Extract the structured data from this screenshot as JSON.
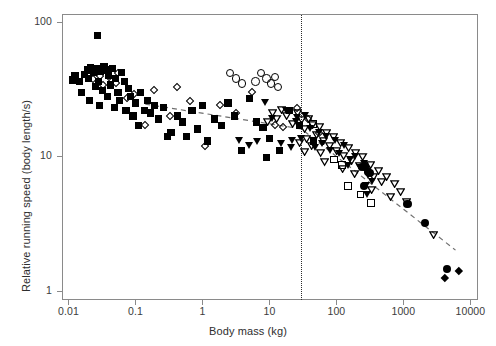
{
  "chart_data": {
    "type": "scatter",
    "title": "",
    "xlabel": "Body mass (kg)",
    "ylabel": "Relative running speed (body length/s)",
    "xscale": "log",
    "yscale": "log",
    "xlim": [
      0.008,
      13000
    ],
    "ylim": [
      0.85,
      115
    ],
    "xticks": [
      "0.01",
      "0.1",
      "1",
      "10",
      "100",
      "1000",
      "10000"
    ],
    "xtick_values": [
      0.01,
      0.1,
      1,
      10,
      100,
      1000,
      10000
    ],
    "yticks": [
      "100",
      "10",
      "1"
    ],
    "ytick_values": [
      100,
      10,
      1
    ],
    "grid": false,
    "legend": "none",
    "annotations": [
      {
        "name": "critical-mass-line",
        "type": "vertical-dotted-line",
        "x": 30,
        "label": ""
      },
      {
        "name": "trend-line",
        "type": "dashed-broken-line",
        "points": [
          [
            0.14,
            24.5
          ],
          [
            30,
            16.0
          ],
          [
            6000,
            2.0
          ]
        ]
      }
    ],
    "series": [
      {
        "name": "filled-square",
        "marker": "filled-square",
        "color": "#000000",
        "points": [
          [
            0.0115,
            37.0
          ],
          [
            0.0125,
            40.0
          ],
          [
            0.0145,
            36.0
          ],
          [
            0.0155,
            30.0
          ],
          [
            0.0175,
            41.0
          ],
          [
            0.019,
            44.0
          ],
          [
            0.02,
            38.0
          ],
          [
            0.0205,
            26.0
          ],
          [
            0.0215,
            46.0
          ],
          [
            0.0235,
            42.0
          ],
          [
            0.025,
            33.0
          ],
          [
            0.026,
            45.0
          ],
          [
            0.027,
            80.0
          ],
          [
            0.028,
            36.0
          ],
          [
            0.029,
            24.0
          ],
          [
            0.03,
            43.0
          ],
          [
            0.032,
            31.0
          ],
          [
            0.034,
            47.0
          ],
          [
            0.036,
            44.0
          ],
          [
            0.038,
            28.0
          ],
          [
            0.04,
            40.0
          ],
          [
            0.042,
            34.0
          ],
          [
            0.045,
            45.0
          ],
          [
            0.048,
            23.0
          ],
          [
            0.05,
            38.0
          ],
          [
            0.055,
            30.0
          ],
          [
            0.058,
            26.0
          ],
          [
            0.062,
            42.0
          ],
          [
            0.068,
            36.0
          ],
          [
            0.072,
            22.0
          ],
          [
            0.078,
            32.0
          ],
          [
            0.085,
            28.0
          ],
          [
            0.092,
            20.0
          ],
          [
            0.1,
            25.0
          ],
          [
            0.11,
            17.0
          ],
          [
            0.12,
            30.0
          ],
          [
            0.135,
            22.0
          ],
          [
            0.15,
            26.0
          ],
          [
            0.17,
            21.0
          ],
          [
            0.19,
            24.0
          ],
          [
            0.22,
            19.0
          ],
          [
            0.26,
            23.0
          ],
          [
            0.3,
            14.0
          ],
          [
            0.34,
            15.0
          ],
          [
            0.42,
            20.0
          ],
          [
            0.5,
            18.0
          ],
          [
            0.58,
            14.0
          ],
          [
            0.7,
            22.0
          ],
          [
            0.85,
            16.0
          ],
          [
            1.0,
            24.0
          ],
          [
            1.2,
            13.0
          ],
          [
            1.5,
            19.0
          ],
          [
            1.9,
            17.0
          ],
          [
            2.4,
            25.0
          ],
          [
            3.0,
            20.0
          ],
          [
            3.8,
            11.0
          ],
          [
            5.0,
            27.0
          ],
          [
            6.5,
            18.0
          ],
          [
            8.0,
            16.5
          ],
          [
            10.0,
            13.5
          ],
          [
            14.0,
            11.0
          ],
          [
            20.0,
            22.0
          ],
          [
            28.0,
            17.0
          ],
          [
            45.0,
            13.0
          ],
          [
            9.0,
            9.8
          ]
        ]
      },
      {
        "name": "open-diamond",
        "marker": "open-diamond",
        "color": "#000000",
        "points": [
          [
            0.023,
            38.0
          ],
          [
            0.03,
            40.0
          ],
          [
            0.033,
            34.0
          ],
          [
            0.04,
            39.0
          ],
          [
            0.052,
            35.0
          ],
          [
            0.075,
            27.0
          ],
          [
            0.095,
            29.0
          ],
          [
            0.14,
            17.0
          ],
          [
            0.19,
            31.0
          ],
          [
            0.33,
            20.0
          ],
          [
            0.65,
            26.0
          ],
          [
            1.1,
            12.0
          ],
          [
            1.8,
            24.0
          ],
          [
            3.2,
            21.0
          ],
          [
            5.5,
            30.0
          ],
          [
            12.0,
            17.0
          ],
          [
            16.0,
            16.5
          ],
          [
            26.0,
            23.0
          ],
          [
            38.0,
            19.0
          ],
          [
            55.0,
            15.0
          ],
          [
            0.42,
            33.0
          ],
          [
            0.055,
            42.0
          ]
        ]
      },
      {
        "name": "open-circle",
        "marker": "open-circle",
        "color": "#000000",
        "points": [
          [
            2.6,
            42.0
          ],
          [
            3.2,
            38.0
          ],
          [
            3.9,
            35.0
          ],
          [
            7.5,
            42.0
          ],
          [
            9.0,
            38.0
          ],
          [
            10.5,
            35.0
          ],
          [
            12.0,
            39.0
          ],
          [
            13.5,
            33.0
          ],
          [
            6.2,
            36.0
          ]
        ]
      },
      {
        "name": "filled-triangle-down",
        "marker": "filled-triangle-down",
        "color": "#000000",
        "points": [
          [
            8.5,
            25.0
          ],
          [
            11.0,
            19.0
          ],
          [
            15.0,
            12.5
          ],
          [
            18.0,
            22.0
          ],
          [
            22.0,
            13.0
          ],
          [
            26.0,
            19.5
          ],
          [
            30.0,
            13.5
          ],
          [
            34.0,
            20.0
          ],
          [
            40.0,
            16.0
          ],
          [
            48.0,
            11.5
          ],
          [
            55.0,
            15.0
          ],
          [
            62.0,
            12.5
          ],
          [
            70.0,
            14.0
          ],
          [
            80.0,
            11.0
          ],
          [
            95.0,
            13.0
          ],
          [
            110.0,
            10.5
          ],
          [
            130.0,
            12.0
          ],
          [
            160.0,
            9.5
          ],
          [
            190.0,
            10.0
          ],
          [
            230.0,
            8.2
          ],
          [
            260.0,
            8.8
          ],
          [
            300.0,
            7.2
          ],
          [
            340.0,
            6.5
          ],
          [
            3.5,
            13.0
          ],
          [
            5.0,
            12.0
          ],
          [
            6.5,
            12.8
          ],
          [
            150.0,
            8.5
          ],
          [
            280.0,
            6.0
          ],
          [
            290.0,
            5.2
          ],
          [
            21.0,
            11.5
          ],
          [
            25.0,
            18.0
          ]
        ]
      },
      {
        "name": "open-triangle-down",
        "marker": "open-triangle-down",
        "color": "#000000",
        "points": [
          [
            18.0,
            20.0
          ],
          [
            22.0,
            17.5
          ],
          [
            26.0,
            21.0
          ],
          [
            30.0,
            18.5
          ],
          [
            34.0,
            16.0
          ],
          [
            38.0,
            19.0
          ],
          [
            44.0,
            17.0
          ],
          [
            50.0,
            14.5
          ],
          [
            56.0,
            16.5
          ],
          [
            64.0,
            13.0
          ],
          [
            72.0,
            15.0
          ],
          [
            80.0,
            12.0
          ],
          [
            90.0,
            14.0
          ],
          [
            100.0,
            11.0
          ],
          [
            115.0,
            12.5
          ],
          [
            130.0,
            10.0
          ],
          [
            150.0,
            11.5
          ],
          [
            170.0,
            9.2
          ],
          [
            195.0,
            10.5
          ],
          [
            220.0,
            8.5
          ],
          [
            250.0,
            9.8
          ],
          [
            285.0,
            7.8
          ],
          [
            320.0,
            8.6
          ],
          [
            360.0,
            7.0
          ],
          [
            420.0,
            7.8
          ],
          [
            480.0,
            6.4
          ],
          [
            560.0,
            7.0
          ],
          [
            650.0,
            5.0
          ],
          [
            750.0,
            6.2
          ],
          [
            900.0,
            5.4
          ],
          [
            1100.0,
            4.6
          ],
          [
            2800.0,
            2.6
          ],
          [
            15.0,
            22.0
          ],
          [
            13.0,
            19.0
          ],
          [
            11.0,
            21.0
          ],
          [
            9.5,
            18.0
          ],
          [
            42.0,
            12.0
          ],
          [
            58.0,
            10.5
          ],
          [
            125.0,
            8.0
          ],
          [
            190.0,
            7.4
          ],
          [
            340.0,
            5.6
          ],
          [
            36.0,
            13.5
          ],
          [
            33.0,
            10.8
          ],
          [
            28.0,
            12.5
          ],
          [
            66.0,
            9.0
          ]
        ]
      },
      {
        "name": "open-square",
        "marker": "open-square",
        "color": "#000000",
        "points": [
          [
            45.0,
            17.5
          ],
          [
            120.0,
            8.6
          ],
          [
            150.0,
            6.0
          ],
          [
            230.0,
            5.2
          ],
          [
            330.0,
            4.5
          ],
          [
            92.0,
            9.5
          ]
        ]
      },
      {
        "name": "filled-circle",
        "marker": "filled-circle",
        "color": "#000000",
        "points": [
          [
            240.0,
            8.3
          ],
          [
            265.0,
            8.4
          ],
          [
            300.0,
            7.6
          ],
          [
            320.0,
            7.5
          ],
          [
            260.0,
            6.0
          ],
          [
            1150.0,
            4.4
          ],
          [
            2100.0,
            3.2
          ],
          [
            4500.0,
            1.45
          ]
        ]
      },
      {
        "name": "filled-diamond",
        "marker": "filled-diamond",
        "color": "#000000",
        "points": [
          [
            4200.0,
            1.25
          ],
          [
            6800.0,
            1.4
          ]
        ]
      }
    ]
  },
  "axes": {
    "x_tick_labels": [
      "0.01",
      "0.1",
      "1",
      "10",
      "100",
      "1000",
      "10000"
    ],
    "y_tick_labels": [
      "100",
      "10",
      "1"
    ],
    "x_axis_title": "Body mass (kg)",
    "y_axis_title": "Relative running speed (body length/s)"
  }
}
